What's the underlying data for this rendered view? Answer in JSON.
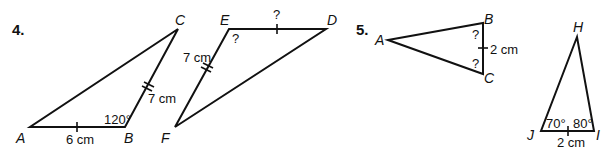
{
  "problems": [
    {
      "number": "4.",
      "figures": [
        {
          "name": "triangle-ABC",
          "vertices": {
            "A": "A",
            "B": "B",
            "C": "C"
          },
          "side_AB": "6 cm",
          "side_BC": "7 cm",
          "angle_B": "120°"
        },
        {
          "name": "triangle-DEF",
          "vertices": {
            "D": "D",
            "E": "E",
            "F": "F"
          },
          "side_ED": "?",
          "side_EF": "7 cm",
          "angle_E": "?"
        }
      ]
    },
    {
      "number": "5.",
      "figures": [
        {
          "name": "triangle-ABC",
          "vertices": {
            "A": "A",
            "B": "B",
            "C": "C"
          },
          "side_BC": "2 cm",
          "angle_B": "?",
          "angle_C": "?"
        },
        {
          "name": "triangle-HIJ",
          "vertices": {
            "H": "H",
            "I": "I",
            "J": "J"
          },
          "side_JI": "2 cm",
          "angle_J": "70°",
          "angle_I": "80°"
        }
      ]
    }
  ]
}
